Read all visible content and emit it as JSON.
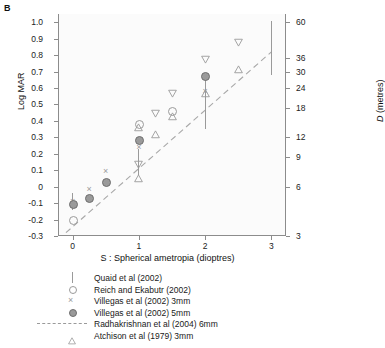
{
  "panel_label": "B",
  "chart_data": {
    "type": "scatter",
    "title": "",
    "xlabel": "S : Spherical ametropia (dioptres)",
    "ylabel": "Log MAR",
    "y2label": "D (metres)",
    "xlim": [
      -0.22,
      3.22
    ],
    "ylim": [
      -0.3,
      1.05
    ],
    "grid": false,
    "legend_position": "below",
    "xticks": [
      0,
      1,
      2,
      3
    ],
    "xtick_labels": [
      "0",
      "1",
      "2",
      "3"
    ],
    "yticks": [
      1.0,
      0.9,
      0.8,
      0.7,
      0.6,
      0.5,
      0.4,
      0.3,
      0.2,
      0.1,
      0,
      -0.1,
      -0.2,
      -0.3
    ],
    "ytick_labels": [
      "1.0",
      "0.9",
      "0.8",
      "0.7",
      "0.6",
      "0.5",
      "0.4",
      "0.3",
      "0.2",
      "0.1",
      "0",
      "-0.1",
      "-0.2",
      "-0.3"
    ],
    "y2ticks_logmar": [
      1.0,
      0.78,
      0.7,
      0.6,
      0.48,
      0.3,
      0.18,
      0.0,
      -0.3
    ],
    "y2tick_labels": [
      "60",
      "36",
      "30",
      "24",
      "18",
      "12",
      "9",
      "6",
      "3"
    ],
    "series": [
      {
        "name": "Quaid et al (2002)",
        "marker": "errorbar",
        "points": [
          {
            "x": 0.0,
            "y": -0.09,
            "ylow": -0.14,
            "yhigh": -0.04
          },
          {
            "x": 1.0,
            "y": 0.15,
            "ylow": 0.07,
            "yhigh": 0.23
          },
          {
            "x": 2.0,
            "y": 0.5,
            "ylow": 0.35,
            "yhigh": 0.67
          },
          {
            "x": 3.0,
            "y": 0.83,
            "ylow": 0.68,
            "yhigh": 1.01
          }
        ]
      },
      {
        "name": "Reich and Ekabutr (2002)",
        "marker": "open-circle",
        "points": [
          {
            "x": 0.0,
            "y": -0.2
          },
          {
            "x": 1.0,
            "y": 0.38
          },
          {
            "x": 1.5,
            "y": 0.46
          }
        ]
      },
      {
        "name": "Villegas et al (2002) 3mm",
        "marker": "cross",
        "points": [
          {
            "x": 0.0,
            "y": -0.09
          },
          {
            "x": 0.25,
            "y": -0.02
          },
          {
            "x": 0.5,
            "y": 0.09
          },
          {
            "x": 1.0,
            "y": 0.24
          },
          {
            "x": 2.0,
            "y": 0.58
          }
        ]
      },
      {
        "name": "Villegas et al (2002) 5mm",
        "marker": "filled-circle",
        "points": [
          {
            "x": 0.0,
            "y": -0.105
          },
          {
            "x": 0.25,
            "y": -0.07
          },
          {
            "x": 0.5,
            "y": 0.03
          },
          {
            "x": 1.0,
            "y": 0.285
          },
          {
            "x": 2.0,
            "y": 0.67
          }
        ]
      },
      {
        "name": "Radhakrishnan et al (2004) 6mm",
        "marker": "dashed-line",
        "line": [
          {
            "x": -0.1,
            "y": -0.28
          },
          {
            "x": 3.0,
            "y": 0.82
          }
        ]
      },
      {
        "name": "Atchison et al (1979) 3mm",
        "marker": "triangle-up",
        "points": [
          {
            "x": 1.0,
            "y": 0.08
          },
          {
            "x": 1.0,
            "y": 0.39
          },
          {
            "x": 1.25,
            "y": 0.345
          },
          {
            "x": 1.5,
            "y": 0.455
          },
          {
            "x": 2.0,
            "y": 0.6
          },
          {
            "x": 2.5,
            "y": 0.745
          }
        ]
      },
      {
        "name": "Atchison et al (1979) triangle-down",
        "marker": "triangle-down",
        "points": [
          {
            "x": 1.0,
            "y": 0.165
          },
          {
            "x": 1.25,
            "y": 0.475
          },
          {
            "x": 1.5,
            "y": 0.595
          },
          {
            "x": 2.0,
            "y": 0.805
          },
          {
            "x": 2.5,
            "y": 0.905
          }
        ]
      }
    ]
  },
  "legend": {
    "items": [
      {
        "label": "Quaid et al (2002)",
        "key": "errorbar"
      },
      {
        "label": "Reich and Ekabutr (2002)",
        "key": "open-circle"
      },
      {
        "label": "Villegas et al (2002) 3mm",
        "key": "cross"
      },
      {
        "label": "Villegas et al (2002) 5mm",
        "key": "filled-circle"
      },
      {
        "label": "Radhakrishnan et al (2004) 6mm",
        "key": "dashed-line"
      },
      {
        "label": "Atchison et al (1979) 3mm",
        "key": "triangle-up"
      }
    ]
  },
  "colors": {
    "marker": "#9a9a9a",
    "marker_edge": "#6f6f6f",
    "axis": "#8c8c8c",
    "text": "#1a1a1a",
    "plot_bg": "#fbfbfb"
  }
}
